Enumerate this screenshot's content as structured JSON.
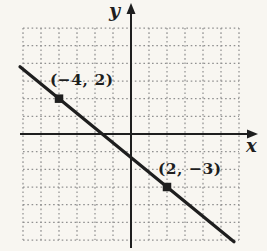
{
  "figure": {
    "background_color": "#f8f6f1",
    "ink_color": "#1e1e1e",
    "grid_dot_color": "#919191",
    "axis_labels": {
      "x": "x",
      "y": "y"
    },
    "point_labels": [
      {
        "text": "(−4, 2)"
      },
      {
        "text": "(2, −3)"
      }
    ]
  },
  "chart_data": {
    "type": "line",
    "title": "",
    "xlabel": "x",
    "ylabel": "y",
    "xlim": [
      -6,
      6
    ],
    "ylim": [
      -6,
      6
    ],
    "grid": "dotted",
    "series": [
      {
        "name": "line-through-two-points",
        "points": [
          {
            "x": -4,
            "y": 2
          },
          {
            "x": 2,
            "y": -3
          }
        ],
        "marker": "filled-square",
        "annotations": [
          "(−4, 2)",
          "(2, −3)"
        ]
      }
    ],
    "legend": "none"
  }
}
